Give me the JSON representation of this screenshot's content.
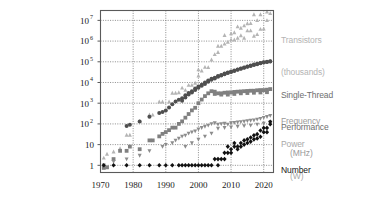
{
  "chart_data": {
    "type": "scatter",
    "title": "",
    "subtitle": "",
    "xlabel": "",
    "ylabel": "",
    "xlim": [
      1970,
      2023
    ],
    "ylim": [
      0.45,
      30000000
    ],
    "yscale": "log",
    "grid": true,
    "legend_position": "right-outside",
    "xticks": [
      1970,
      1980,
      1990,
      2000,
      2010,
      2020
    ],
    "xticklabels": [
      "1970",
      "1980",
      "1990",
      "2000",
      "2010",
      "2020"
    ],
    "yticks": [
      1,
      10,
      100,
      1000,
      10000,
      100000,
      1000000,
      10000000
    ],
    "yticklabels": [
      "1",
      "10",
      "10²",
      "10³",
      "10⁴",
      "10⁵",
      "10⁶",
      "10⁷"
    ],
    "ytick_bases": [
      "1",
      "10",
      "10",
      "10",
      "10",
      "10",
      "10",
      "10"
    ],
    "ytick_exps": [
      "",
      "",
      "2",
      "3",
      "4",
      "5",
      "6",
      "7"
    ],
    "series": [
      {
        "name": "Transistors (thousands)",
        "color": "#b4b4b4",
        "marker": "triangle",
        "label_lines": [
          "Transistors",
          "(thousands)"
        ],
        "points": [
          [
            1971,
            2.3
          ],
          [
            1972,
            3.5
          ],
          [
            1974,
            4.5
          ],
          [
            1976,
            6.5
          ],
          [
            1978,
            29
          ],
          [
            1979,
            29
          ],
          [
            1982,
            134
          ],
          [
            1985,
            275
          ],
          [
            1986,
            273
          ],
          [
            1988,
            1180
          ],
          [
            1989,
            1180
          ],
          [
            1991,
            1185
          ],
          [
            1992,
            3100
          ],
          [
            1993,
            3100
          ],
          [
            1994,
            3300
          ],
          [
            1995,
            5500
          ],
          [
            1996,
            4300
          ],
          [
            1997,
            7500
          ],
          [
            1998,
            7500
          ],
          [
            1999,
            9500
          ],
          [
            2000,
            21000
          ],
          [
            2000,
            42000
          ],
          [
            2001,
            37000
          ],
          [
            2002,
            55000
          ],
          [
            2003,
            54000
          ],
          [
            2004,
            125000
          ],
          [
            2005,
            228000
          ],
          [
            2006,
            291000
          ],
          [
            2006,
            582000
          ],
          [
            2007,
            582000
          ],
          [
            2008,
            731000
          ],
          [
            2008,
            1900000
          ],
          [
            2009,
            904000
          ],
          [
            2010,
            1170000
          ],
          [
            2010,
            2300000
          ],
          [
            2011,
            1160000
          ],
          [
            2011,
            2600000
          ],
          [
            2012,
            1400000
          ],
          [
            2012,
            5000000
          ],
          [
            2013,
            1860000
          ],
          [
            2013,
            4310000
          ],
          [
            2014,
            1400000
          ],
          [
            2014,
            5560000
          ],
          [
            2015,
            3200000
          ],
          [
            2015,
            7100000
          ],
          [
            2016,
            3200000
          ],
          [
            2016,
            7200000
          ],
          [
            2017,
            1750000
          ],
          [
            2017,
            19200000
          ],
          [
            2018,
            2100000
          ],
          [
            2018,
            10000000
          ],
          [
            2019,
            3800000
          ],
          [
            2019,
            19200000
          ],
          [
            2020,
            3900000
          ],
          [
            2020,
            39540000
          ],
          [
            2021,
            10000000
          ],
          [
            2021,
            26000000
          ],
          [
            2022,
            21700000
          ],
          [
            2022,
            57000000
          ]
        ]
      },
      {
        "name": "Single-Thread Performance (SpecINT x 10^3)",
        "color": "#4f4f4f",
        "marker": "circle",
        "label_lines": [
          "Single-Thread",
          "Performance"
        ],
        "points": [
          [
            1978,
            80
          ],
          [
            1979,
            90
          ],
          [
            1982,
            130
          ],
          [
            1985,
            220
          ],
          [
            1988,
            340
          ],
          [
            1989,
            380
          ],
          [
            1990,
            450
          ],
          [
            1991,
            620
          ],
          [
            1992,
            900
          ],
          [
            1993,
            1200
          ],
          [
            1994,
            1450
          ],
          [
            1995,
            1750
          ],
          [
            1996,
            2400
          ],
          [
            1997,
            3100
          ],
          [
            1998,
            3800
          ],
          [
            1999,
            5200
          ],
          [
            2000,
            6400
          ],
          [
            2001,
            7800
          ],
          [
            2002,
            9900
          ],
          [
            2003,
            12500
          ],
          [
            2004,
            15000
          ],
          [
            2005,
            17000
          ],
          [
            2006,
            20500
          ],
          [
            2007,
            23000
          ],
          [
            2008,
            27000
          ],
          [
            2009,
            30000
          ],
          [
            2010,
            34000
          ],
          [
            2011,
            38000
          ],
          [
            2012,
            43000
          ],
          [
            2013,
            48000
          ],
          [
            2014,
            53000
          ],
          [
            2015,
            60000
          ],
          [
            2016,
            66000
          ],
          [
            2017,
            73000
          ],
          [
            2018,
            80000
          ],
          [
            2019,
            87000
          ],
          [
            2020,
            95000
          ],
          [
            2021,
            100000
          ],
          [
            2022,
            105000
          ],
          [
            1995,
            1300
          ],
          [
            1996,
            1900
          ],
          [
            1997,
            2600
          ],
          [
            1998,
            3300
          ],
          [
            1999,
            4400
          ],
          [
            2000,
            5500
          ],
          [
            2001,
            6900
          ],
          [
            2002,
            8500
          ],
          [
            2003,
            11000
          ],
          [
            2004,
            13500
          ],
          [
            2005,
            15500
          ],
          [
            2006,
            19000
          ],
          [
            2007,
            21500
          ],
          [
            2008,
            25000
          ],
          [
            2009,
            28500
          ],
          [
            2010,
            32000
          ],
          [
            2011,
            36000
          ],
          [
            2012,
            41000
          ],
          [
            2013,
            46000
          ],
          [
            2014,
            51000
          ],
          [
            2015,
            57000
          ],
          [
            2016,
            63000
          ],
          [
            2017,
            70000
          ],
          [
            2018,
            77000
          ],
          [
            2019,
            84000
          ],
          [
            2020,
            92000
          ],
          [
            2021,
            98000
          ],
          [
            2022,
            102000
          ]
        ]
      },
      {
        "name": "Frequency (MHz)",
        "color": "#808080",
        "marker": "square",
        "label_lines": [
          "Frequency",
          "   (MHz)"
        ],
        "points": [
          [
            1971,
            0.75
          ],
          [
            1972,
            0.8
          ],
          [
            1974,
            2
          ],
          [
            1976,
            5
          ],
          [
            1978,
            5
          ],
          [
            1979,
            8
          ],
          [
            1982,
            6
          ],
          [
            1985,
            16
          ],
          [
            1986,
            16
          ],
          [
            1988,
            25
          ],
          [
            1989,
            33
          ],
          [
            1990,
            40
          ],
          [
            1991,
            50
          ],
          [
            1992,
            66
          ],
          [
            1993,
            66
          ],
          [
            1994,
            100
          ],
          [
            1995,
            133
          ],
          [
            1996,
            200
          ],
          [
            1997,
            300
          ],
          [
            1998,
            450
          ],
          [
            1999,
            600
          ],
          [
            2000,
            1000
          ],
          [
            2001,
            1500
          ],
          [
            2002,
            2200
          ],
          [
            2003,
            3000
          ],
          [
            2004,
            3800
          ],
          [
            2005,
            3600
          ],
          [
            2006,
            3000
          ],
          [
            2007,
            3000
          ],
          [
            2008,
            3200
          ],
          [
            2009,
            3300
          ],
          [
            2010,
            3300
          ],
          [
            2011,
            3500
          ],
          [
            2012,
            3600
          ],
          [
            2013,
            3700
          ],
          [
            2014,
            3800
          ],
          [
            2015,
            3900
          ],
          [
            2016,
            4000
          ],
          [
            2017,
            4000
          ],
          [
            2018,
            4200
          ],
          [
            2019,
            4300
          ],
          [
            2020,
            4300
          ],
          [
            2021,
            4500
          ],
          [
            2022,
            4800
          ],
          [
            2005,
            2800
          ],
          [
            2007,
            2600
          ],
          [
            2009,
            2600
          ],
          [
            2011,
            2800
          ],
          [
            2013,
            3000
          ],
          [
            2015,
            3100
          ],
          [
            2017,
            3200
          ],
          [
            2019,
            3300
          ],
          [
            2021,
            3400
          ]
        ]
      },
      {
        "name": "Typical Power (Watts)",
        "color": "#8c8c8c",
        "marker": "triangle-down",
        "label_lines": [
          "Power",
          " (W)"
        ],
        "points": [
          [
            1971,
            1
          ],
          [
            1974,
            1.5
          ],
          [
            1978,
            2
          ],
          [
            1982,
            3
          ],
          [
            1985,
            5
          ],
          [
            1989,
            8
          ],
          [
            1990,
            10
          ],
          [
            1992,
            12
          ],
          [
            1993,
            16
          ],
          [
            1994,
            20
          ],
          [
            1995,
            25
          ],
          [
            1996,
            28
          ],
          [
            1997,
            35
          ],
          [
            1998,
            40
          ],
          [
            1999,
            45
          ],
          [
            2000,
            55
          ],
          [
            2001,
            65
          ],
          [
            2002,
            75
          ],
          [
            2003,
            85
          ],
          [
            2004,
            100
          ],
          [
            2005,
            110
          ],
          [
            2006,
            95
          ],
          [
            2007,
            100
          ],
          [
            2008,
            105
          ],
          [
            2009,
            95
          ],
          [
            2010,
            110
          ],
          [
            2011,
            115
          ],
          [
            2012,
            120
          ],
          [
            2013,
            125
          ],
          [
            2014,
            130
          ],
          [
            2015,
            140
          ],
          [
            2016,
            145
          ],
          [
            2017,
            150
          ],
          [
            2018,
            165
          ],
          [
            2019,
            180
          ],
          [
            2020,
            200
          ],
          [
            2021,
            220
          ],
          [
            2022,
            250
          ],
          [
            2006,
            60
          ],
          [
            2008,
            65
          ],
          [
            2010,
            70
          ],
          [
            2012,
            75
          ],
          [
            2014,
            80
          ],
          [
            2016,
            85
          ],
          [
            2018,
            95
          ],
          [
            2020,
            105
          ],
          [
            2022,
            120
          ],
          [
            1996,
            8
          ],
          [
            1998,
            12
          ],
          [
            2000,
            18
          ],
          [
            2002,
            25
          ],
          [
            2004,
            35
          ]
        ]
      },
      {
        "name": "Number of Logical Cores",
        "color": "#111111",
        "marker": "diamond",
        "label_lines": [
          "Number",
          "of Cores"
        ],
        "points": [
          [
            1971,
            1
          ],
          [
            1974,
            1
          ],
          [
            1978,
            1
          ],
          [
            1982,
            1
          ],
          [
            1985,
            1
          ],
          [
            1988,
            1
          ],
          [
            1990,
            1
          ],
          [
            1992,
            1
          ],
          [
            1994,
            1
          ],
          [
            1995,
            1
          ],
          [
            1996,
            1
          ],
          [
            1997,
            1
          ],
          [
            1998,
            1
          ],
          [
            1999,
            1
          ],
          [
            2000,
            1
          ],
          [
            2001,
            1
          ],
          [
            2002,
            1
          ],
          [
            2003,
            1
          ],
          [
            2004,
            1
          ],
          [
            2005,
            2
          ],
          [
            2006,
            2
          ],
          [
            2007,
            2
          ],
          [
            2008,
            4
          ],
          [
            2009,
            4
          ],
          [
            2010,
            6
          ],
          [
            2011,
            8
          ],
          [
            2012,
            8
          ],
          [
            2013,
            12
          ],
          [
            2014,
            16
          ],
          [
            2015,
            18
          ],
          [
            2016,
            22
          ],
          [
            2017,
            28
          ],
          [
            2018,
            32
          ],
          [
            2019,
            48
          ],
          [
            2020,
            64
          ],
          [
            2021,
            64
          ],
          [
            2022,
            128
          ],
          [
            2006,
            1
          ],
          [
            2008,
            2
          ],
          [
            2010,
            4
          ],
          [
            2012,
            6
          ],
          [
            2014,
            10
          ],
          [
            2016,
            14
          ],
          [
            2018,
            20
          ],
          [
            2020,
            40
          ],
          [
            2022,
            96
          ],
          [
            2009,
            8
          ],
          [
            2011,
            12
          ],
          [
            2013,
            8
          ],
          [
            2015,
            12
          ],
          [
            2017,
            18
          ],
          [
            2019,
            24
          ],
          [
            2021,
            40
          ]
        ]
      }
    ]
  },
  "legend": {
    "transistors": {
      "line1": "Transistors",
      "line2": "(thousands)",
      "color": "#b4b4b4"
    },
    "single_thread": {
      "line1": "Single-Thread",
      "line2": "Performance",
      "color": "#6e6e6e"
    },
    "frequency": {
      "line1": "Frequency",
      "line2": "(MHz)",
      "color": "#9a9a9a"
    },
    "power": {
      "line1": "Power",
      "line2": "(W)",
      "color": "#a8a8a8"
    },
    "cores": {
      "line1": "Number",
      "line2": "of Cores",
      "color": "#161616"
    }
  },
  "style": {
    "background": "#ffffff",
    "frame_color": "#5a5a5a",
    "grid_color": "#707070",
    "tick_text_color": "#1a1a1a"
  }
}
